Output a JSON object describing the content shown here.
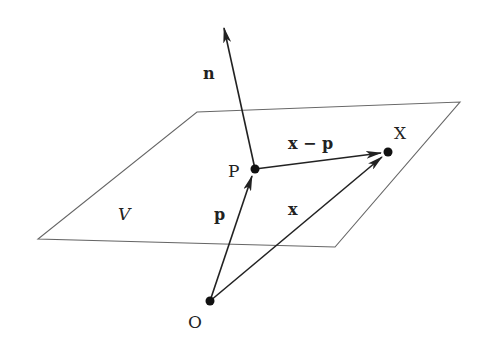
{
  "diagram": {
    "type": "vector-geometry",
    "colors": {
      "line": "#222222",
      "plane": "#666666",
      "background": "#ffffff"
    },
    "plane": {
      "label": "V",
      "corners": [
        [
          197,
          112
        ],
        [
          460,
          102
        ],
        [
          335,
          247
        ],
        [
          38,
          239
        ]
      ]
    },
    "points": {
      "P": {
        "label": "P",
        "x": 255,
        "y": 169
      },
      "X": {
        "label": "X",
        "x": 388,
        "y": 152
      },
      "O": {
        "label": "O",
        "x": 210,
        "y": 301
      }
    },
    "vectors": {
      "n": {
        "label": "n",
        "from": "P",
        "to": [
          224,
          27
        ]
      },
      "p": {
        "label": "p",
        "from": "O",
        "to": "P"
      },
      "x": {
        "label": "x",
        "from": "O",
        "to": "X"
      },
      "x_minus_p": {
        "label": "x − p",
        "from": "P",
        "to": "X"
      }
    }
  }
}
